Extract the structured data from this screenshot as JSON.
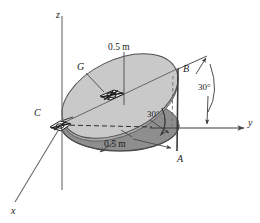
{
  "figure": {
    "kind": "engineering-mechanics-diagram",
    "colors": {
      "inclined_disk_fill": "#c9c9c9",
      "horizontal_disk_fill": "#8e8e8e",
      "disk_edge_band": "#b0b0b0",
      "line": "#58585a",
      "line_dark": "#2b2b2b",
      "text": "#1a1a1a",
      "background": "#ffffff"
    }
  },
  "axes": {
    "z": {
      "label": "z",
      "x": 56,
      "y": 10
    },
    "y": {
      "label": "y",
      "x": 248,
      "y": 118
    },
    "x": {
      "label": "x",
      "x": 11,
      "y": 206
    }
  },
  "points": [
    {
      "id": "G",
      "label": "G",
      "x": 77,
      "y": 62,
      "kind": "support-pin-at-center"
    },
    {
      "id": "C",
      "label": "C",
      "x": 34,
      "y": 108,
      "kind": "support-pin-at-rim"
    },
    {
      "id": "B",
      "label": "B",
      "x": 183,
      "y": 64,
      "kind": "rim-point-upper"
    },
    {
      "id": "A",
      "label": "A",
      "x": 177,
      "y": 154,
      "kind": "rim-point-lower"
    }
  ],
  "dimensions": [
    {
      "id": "radius-top",
      "label": "0.5 m",
      "x": 108,
      "y": 43,
      "measures": "disk radius from G to rim"
    },
    {
      "id": "radius-bottom",
      "label": "0.5 m",
      "x": 104,
      "y": 140,
      "measures": "projected radius on horizontal plane"
    }
  ],
  "angles": [
    {
      "id": "incline-inner",
      "label": "30°",
      "x": 147,
      "y": 110,
      "measures": "disk plane to horizontal plane"
    },
    {
      "id": "incline-outer",
      "label": "30°",
      "x": 198,
      "y": 83,
      "measures": "disk tangent at B to y axis"
    }
  ]
}
